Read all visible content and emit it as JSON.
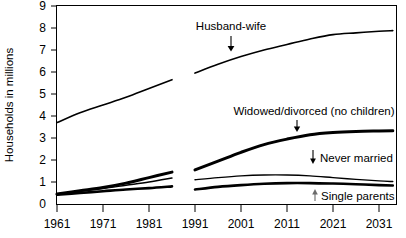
{
  "chart_data": {
    "type": "line",
    "title": "",
    "xlabel": "",
    "ylabel": "Households in millions",
    "xlim": [
      1961,
      2034
    ],
    "ylim": [
      0,
      9
    ],
    "yticks": [
      0,
      1,
      2,
      3,
      4,
      5,
      6,
      7,
      8,
      9
    ],
    "ytick_labels": [
      "0",
      "1",
      "2",
      "3",
      "4",
      "5",
      "6",
      "7",
      "8",
      "9"
    ],
    "xticks": [
      1961,
      1971,
      1981,
      1991,
      2001,
      2011,
      2021,
      2031
    ],
    "xtick_labels": [
      "1961",
      "1971",
      "1981",
      "1991",
      "2001",
      "2011",
      "2021",
      "2031"
    ],
    "grid": false,
    "legend_position": "inline-annotations",
    "series": [
      {
        "name": "Husband-wife",
        "segment": "historic",
        "x": [
          1961,
          1966,
          1971,
          1976,
          1981,
          1986
        ],
        "y": [
          3.7,
          4.15,
          4.5,
          4.85,
          5.25,
          5.65
        ]
      },
      {
        "name": "Husband-wife",
        "segment": "projected",
        "x": [
          1991,
          1996,
          2001,
          2006,
          2011,
          2016,
          2021,
          2026,
          2031,
          2034
        ],
        "y": [
          5.95,
          6.35,
          6.7,
          7.0,
          7.25,
          7.5,
          7.7,
          7.78,
          7.85,
          7.88
        ]
      },
      {
        "name": "Widowed/divorced (no children)",
        "segment": "historic",
        "x": [
          1961,
          1966,
          1971,
          1976,
          1981,
          1986
        ],
        "y": [
          0.45,
          0.6,
          0.75,
          0.95,
          1.2,
          1.45
        ]
      },
      {
        "name": "Widowed/divorced (no children)",
        "segment": "projected",
        "x": [
          1991,
          1996,
          2001,
          2006,
          2011,
          2016,
          2021,
          2026,
          2031,
          2034
        ],
        "y": [
          1.55,
          1.95,
          2.35,
          2.7,
          2.95,
          3.15,
          3.25,
          3.3,
          3.32,
          3.33
        ]
      },
      {
        "name": "Never married",
        "segment": "historic",
        "x": [
          1961,
          1966,
          1971,
          1976,
          1981,
          1986
        ],
        "y": [
          0.45,
          0.58,
          0.7,
          0.85,
          1.0,
          1.18
        ]
      },
      {
        "name": "Never married",
        "segment": "projected",
        "x": [
          1991,
          1996,
          2001,
          2006,
          2011,
          2016,
          2021,
          2026,
          2031,
          2034
        ],
        "y": [
          1.1,
          1.2,
          1.28,
          1.32,
          1.32,
          1.28,
          1.2,
          1.12,
          1.05,
          1.02
        ]
      },
      {
        "name": "Single parents",
        "segment": "historic",
        "x": [
          1961,
          1966,
          1971,
          1976,
          1981,
          1986
        ],
        "y": [
          0.42,
          0.5,
          0.58,
          0.66,
          0.72,
          0.8
        ]
      },
      {
        "name": "Single parents",
        "segment": "projected",
        "x": [
          1991,
          1996,
          2001,
          2006,
          2011,
          2016,
          2021,
          2026,
          2031,
          2034
        ],
        "y": [
          0.66,
          0.78,
          0.86,
          0.92,
          0.95,
          0.95,
          0.93,
          0.9,
          0.86,
          0.84
        ]
      }
    ],
    "annotations": [
      {
        "label": "Husband-wife",
        "arrow": "down"
      },
      {
        "label": "Widowed/divorced (no children)",
        "arrow": "down"
      },
      {
        "label": "Never married",
        "arrow": "down-left"
      },
      {
        "label": "Single parents",
        "arrow": "up-left"
      }
    ]
  }
}
